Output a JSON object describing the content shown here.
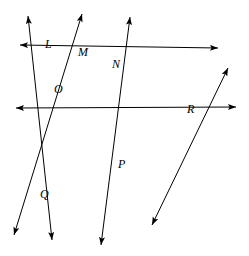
{
  "figure": {
    "type": "geometry-line-diagram",
    "width": 249,
    "height": 256,
    "background_color": "#ffffff",
    "stroke_color": "#000000",
    "stroke_width": 1.0,
    "label_style": "italic-serif",
    "label_font_size": 12
  },
  "lines": [
    {
      "id": "line-1",
      "name": "line-through-L-O-Q",
      "from": {
        "x": 28,
        "y": 16
      },
      "to": {
        "x": 52,
        "y": 240
      },
      "arrow_start": true,
      "arrow_end": true,
      "passes_through": [
        "L",
        "O",
        "Q"
      ]
    },
    {
      "id": "line-2",
      "name": "line-through-M-P",
      "from": {
        "x": 82,
        "y": 14
      },
      "to": {
        "x": 14,
        "y": 235
      },
      "arrow_start": true,
      "arrow_end": true,
      "passes_through": [
        "M",
        "P"
      ]
    },
    {
      "id": "line-3",
      "name": "line-through-N-P",
      "from": {
        "x": 130,
        "y": 17
      },
      "to": {
        "x": 101,
        "y": 245
      },
      "arrow_start": true,
      "arrow_end": true,
      "passes_through": [
        "N",
        "P"
      ]
    },
    {
      "id": "line-4",
      "name": "line-through-L-M-N",
      "from": {
        "x": 20,
        "y": 45
      },
      "to": {
        "x": 218,
        "y": 48
      },
      "arrow_start": true,
      "arrow_end": true,
      "passes_through": [
        "L",
        "M",
        "N"
      ]
    },
    {
      "id": "line-5",
      "name": "line-through-O-N-R",
      "from": {
        "x": 16,
        "y": 108
      },
      "to": {
        "x": 236,
        "y": 107
      },
      "arrow_start": true,
      "arrow_end": true,
      "passes_through": [
        "O",
        "N",
        "R"
      ]
    },
    {
      "id": "line-6",
      "name": "line-through-Q-P-R",
      "from": {
        "x": 228,
        "y": 68
      },
      "to": {
        "x": 152,
        "y": 225
      },
      "arrow_start": true,
      "arrow_end": true,
      "passes_through": [
        "Q",
        "P",
        "R"
      ]
    }
  ],
  "points": [
    {
      "id": "L",
      "label": "L",
      "x": 52,
      "y": 52,
      "label_x": 45,
      "label_y": 38
    },
    {
      "id": "M",
      "label": "M",
      "x": 78,
      "y": 60,
      "label_x": 78,
      "label_y": 46
    },
    {
      "id": "N",
      "label": "N",
      "x": 124,
      "y": 74,
      "label_x": 112,
      "label_y": 58
    },
    {
      "id": "O",
      "label": "O",
      "x": 72,
      "y": 92,
      "label_x": 54,
      "label_y": 83
    },
    {
      "id": "P",
      "label": "P",
      "x": 113,
      "y": 162,
      "label_x": 118,
      "label_y": 158
    },
    {
      "id": "Q",
      "label": "Q",
      "x": 56,
      "y": 203,
      "label_x": 40,
      "label_y": 188
    },
    {
      "id": "R",
      "label": "R",
      "x": 194,
      "y": 103,
      "label_x": 187,
      "label_y": 103
    }
  ]
}
